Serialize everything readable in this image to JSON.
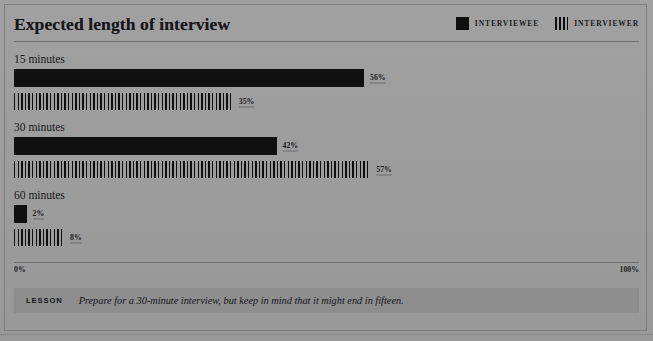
{
  "figure": {
    "title": "Expected length of interview",
    "lesson_tag": "LESSON",
    "lesson_text": "Prepare for a 30-minute interview, but keep in mind that it might end in fifteen."
  },
  "legend": {
    "items": [
      {
        "label": "INTERVIEWEE",
        "swatch": "solid-square-icon",
        "color": "#100f10"
      },
      {
        "label": "INTERVIEWER",
        "swatch": "striped-square-icon",
        "color": "#100f10"
      }
    ]
  },
  "axis": {
    "min_label": "0%",
    "max_label": "100%"
  },
  "chart_data": {
    "type": "bar",
    "title": "Expected length of interview",
    "subtitle": "",
    "xlabel": "",
    "ylabel": "",
    "orientation": "horizontal",
    "grouped": true,
    "categories": [
      "15 minutes",
      "30 minutes",
      "60 minutes"
    ],
    "series": [
      {
        "name": "INTERVIEWEE",
        "style": "solid",
        "color": "#100f10",
        "values": [
          56,
          42,
          2
        ],
        "value_labels": [
          "56%",
          "42%",
          "2%"
        ]
      },
      {
        "name": "INTERVIEWER",
        "style": "striped",
        "color": "#100f10",
        "values": [
          35,
          57,
          8
        ],
        "value_labels": [
          "35%",
          "57%",
          "8%"
        ]
      }
    ],
    "xlim": [
      0,
      100
    ],
    "xtick_labels": [
      "0%",
      "100%"
    ],
    "grid": false,
    "legend_position": "top-right",
    "units": "percent",
    "annotations": [
      "LESSON: Prepare for a 30-minute interview, but keep in mind that it might end in fifteen."
    ]
  }
}
